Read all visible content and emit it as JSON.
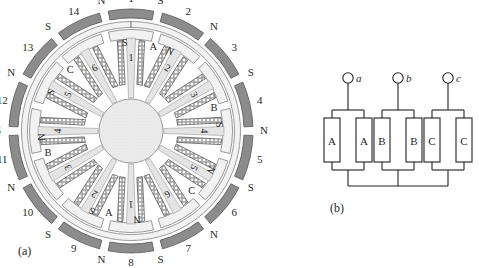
{
  "figure": {
    "panel_a_label": "(a)",
    "panel_b_label": "(b)",
    "background_color": "#ffffff",
    "ink_color": "#1f1f1f"
  },
  "motor": {
    "name": "brushless-dc-motor-cross-section",
    "rotor_pole_count": 14,
    "stator_slot_count": 12,
    "colors": {
      "magnet_fill": "#8c8c8c",
      "magnet_stroke": "#555555",
      "yoke_fill": "#f2f2f2",
      "tooth_fill": "#e4e4e4",
      "hub_fill": "#e9e9e9",
      "coil_fill": "#ffffff",
      "coil_stroke": "#4a4a4a"
    },
    "pole_numbers": [
      "1",
      "2",
      "3",
      "4",
      "5",
      "6",
      "7",
      "8",
      "9",
      "10",
      "11",
      "12",
      "13",
      "14"
    ],
    "pole_polarities": [
      "S",
      "N",
      "S",
      "N",
      "S",
      "N",
      "S",
      "N",
      "S",
      "N",
      "S",
      "N",
      "S",
      "N"
    ],
    "slot_numbers": [
      "1",
      "2",
      "3",
      "4",
      "5",
      "6",
      "1",
      "2",
      "3",
      "4",
      "5",
      "6"
    ],
    "slot_polarities": [
      "S",
      "N",
      "",
      "S",
      "N",
      "",
      "N",
      "S",
      "",
      "N",
      "S",
      ""
    ],
    "phase_labels": [
      "A",
      "B",
      "C",
      "A",
      "B",
      "C"
    ],
    "phase_label_positions": [
      "A",
      "B",
      "C",
      "A",
      "B",
      "C"
    ]
  },
  "circuit": {
    "name": "three-phase-parallel-winding-connection",
    "terminals": [
      {
        "id": "a",
        "label": "a"
      },
      {
        "id": "b",
        "label": "b"
      },
      {
        "id": "c",
        "label": "c"
      }
    ],
    "phases": [
      {
        "name": "A",
        "coils": [
          "A",
          "A"
        ]
      },
      {
        "name": "B",
        "coils": [
          "B",
          "B"
        ]
      },
      {
        "name": "C",
        "coils": [
          "C",
          "C"
        ]
      }
    ],
    "connection": "wye-star-common-node"
  }
}
